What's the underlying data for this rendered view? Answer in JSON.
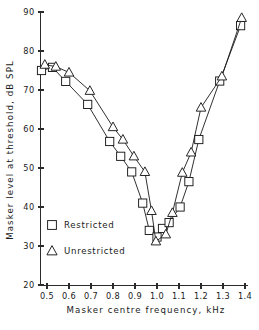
{
  "chart_data": {
    "type": "line",
    "title": "",
    "xlabel": "Masker centre frequency, kHz",
    "ylabel": "Masker level at threshold, dB SPL",
    "xlim": [
      0.44,
      1.41
    ],
    "ylim": [
      20,
      90
    ],
    "xticks": [
      0.5,
      0.6,
      0.7,
      0.8,
      0.9,
      1.0,
      1.1,
      1.2,
      1.3,
      1.4
    ],
    "xticklabels": [
      "0.5",
      "0.6",
      "0.7",
      "0.8",
      "0.9",
      "1.0",
      "1.1",
      "1.2",
      "1.3",
      "1.4"
    ],
    "yticks": [
      20,
      30,
      40,
      50,
      60,
      70,
      80,
      90
    ],
    "yticklabels": [
      "20",
      "30",
      "40",
      "50",
      "60",
      "70",
      "80",
      "90"
    ],
    "grid": false,
    "legend_position": "lower-left",
    "series": [
      {
        "name": "Restricted",
        "marker": "square",
        "x": [
          0.475,
          0.525,
          0.585,
          0.685,
          0.785,
          0.835,
          0.885,
          0.935,
          0.965,
          1.0,
          1.025,
          1.055,
          1.105,
          1.145,
          1.19,
          1.285,
          1.38
        ],
        "y": [
          75.0,
          75.8,
          72.2,
          66.3,
          56.8,
          53.0,
          49.0,
          41.0,
          34.0,
          32.3,
          34.5,
          36.0,
          40.0,
          46.5,
          57.3,
          72.3,
          86.5
        ]
      },
      {
        "name": "Unrestricted",
        "marker": "triangle",
        "x": [
          0.49,
          0.54,
          0.6,
          0.695,
          0.8,
          0.845,
          0.895,
          0.945,
          0.975,
          0.995,
          1.04,
          1.07,
          1.115,
          1.155,
          1.2,
          1.295,
          1.385
        ],
        "y": [
          76.5,
          76.0,
          74.5,
          69.8,
          60.5,
          57.3,
          53.0,
          49.0,
          39.0,
          31.2,
          33.0,
          38.5,
          48.8,
          54.0,
          65.5,
          73.5,
          88.5
        ]
      }
    ],
    "legend_entries": [
      {
        "marker": "square",
        "label": "Restricted"
      },
      {
        "marker": "triangle",
        "label": "Unrestricted"
      }
    ]
  }
}
